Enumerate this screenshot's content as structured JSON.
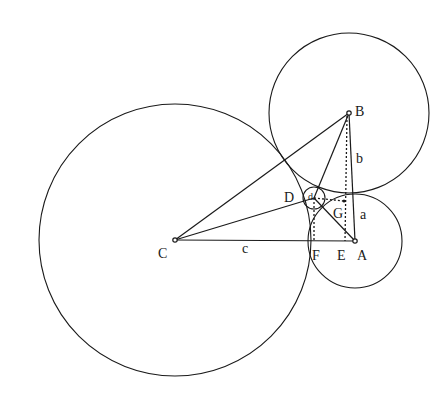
{
  "diagram": {
    "stroke_color": "#1a1a1a",
    "background": "#ffffff",
    "points": [
      {
        "id": "A",
        "label": "A",
        "x": 355,
        "y": 241,
        "lx": 357,
        "ly": 260
      },
      {
        "id": "B",
        "label": "B",
        "x": 349,
        "y": 113,
        "lx": 355,
        "ly": 116
      },
      {
        "id": "C",
        "label": "C",
        "x": 175,
        "y": 240,
        "lx": 158,
        "ly": 258
      },
      {
        "id": "D",
        "label": "D",
        "x": 314,
        "y": 198,
        "lx": 284,
        "ly": 202
      },
      {
        "id": "E",
        "label": "E",
        "x": 345,
        "y": 241,
        "lx": 337,
        "ly": 260
      },
      {
        "id": "F",
        "label": "F",
        "x": 314,
        "y": 241,
        "lx": 312,
        "ly": 260
      },
      {
        "id": "G",
        "label": "G",
        "x": 344,
        "y": 203,
        "lx": 333,
        "ly": 218
      }
    ],
    "side_labels": [
      {
        "id": "a",
        "label": "a",
        "x": 360,
        "y": 219
      },
      {
        "id": "b",
        "label": "b",
        "x": 356,
        "y": 163
      },
      {
        "id": "c",
        "label": "c",
        "x": 242,
        "y": 253
      },
      {
        "id": "d",
        "label": "d",
        "x": 308,
        "y": 200
      }
    ],
    "circles": [
      {
        "id": "circle-C",
        "cx": 175,
        "cy": 240,
        "r": 136
      },
      {
        "id": "circle-B",
        "cx": 349,
        "cy": 113,
        "r": 80
      },
      {
        "id": "circle-A",
        "cx": 355,
        "cy": 241,
        "r": 47
      },
      {
        "id": "circle-D",
        "cx": 314,
        "cy": 198,
        "r": 11
      }
    ],
    "solid_segments": [
      {
        "id": "CA",
        "x1": 175,
        "y1": 240,
        "x2": 355,
        "y2": 241
      },
      {
        "id": "CB",
        "x1": 175,
        "y1": 240,
        "x2": 349,
        "y2": 113
      },
      {
        "id": "CD",
        "x1": 175,
        "y1": 240,
        "x2": 314,
        "y2": 198
      },
      {
        "id": "BA",
        "x1": 349,
        "y1": 113,
        "x2": 355,
        "y2": 241
      },
      {
        "id": "BD",
        "x1": 349,
        "y1": 113,
        "x2": 314,
        "y2": 198
      },
      {
        "id": "DA",
        "x1": 314,
        "y1": 198,
        "x2": 355,
        "y2": 241
      }
    ],
    "dotted_segments": [
      {
        "id": "BE",
        "x1": 347,
        "y1": 116,
        "x2": 345,
        "y2": 241
      },
      {
        "id": "DF",
        "x1": 314,
        "y1": 198,
        "x2": 314,
        "y2": 241
      },
      {
        "id": "DG",
        "x1": 314,
        "y1": 198,
        "x2": 344,
        "y2": 201
      }
    ]
  }
}
